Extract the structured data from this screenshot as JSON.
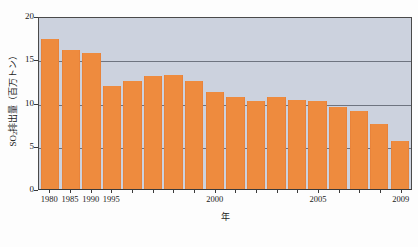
{
  "chart_data": {
    "type": "bar",
    "title": "",
    "subtitle": "",
    "xlabel": "年",
    "ylabel": "SO₂排出量（百万トン）",
    "ylabel_main": "SO",
    "ylabel_sub": "2",
    "ylabel_rest": "排出量（百万トン）",
    "ylim": [
      0,
      20
    ],
    "yticks": [
      20,
      15,
      10,
      5,
      0
    ],
    "ytick_labels": [
      "20",
      "15",
      "10",
      "5",
      "0"
    ],
    "gridlines": [
      15,
      10,
      5
    ],
    "grid": true,
    "legend": "none",
    "xtick_labels": [
      "1980",
      "1985",
      "1990",
      "1995",
      "2000",
      "2005",
      "2009"
    ],
    "categories": [
      "1980",
      "1985",
      "1990",
      "1995",
      "1996",
      "1997",
      "1998",
      "1999",
      "2000",
      "2001",
      "2002",
      "2003",
      "2004",
      "2005",
      "2006",
      "2007",
      "2008",
      "2009"
    ],
    "values": [
      17.3,
      16.1,
      15.7,
      11.9,
      12.5,
      13.1,
      13.2,
      12.5,
      11.2,
      10.6,
      10.2,
      10.6,
      10.3,
      10.2,
      9.5,
      9.0,
      7.5,
      5.6
    ],
    "bar_color": "#ee8b3e",
    "plot_background": "#ccd2de",
    "axis_color": "#3a3a3a",
    "gridline_color": "#5d6470"
  }
}
